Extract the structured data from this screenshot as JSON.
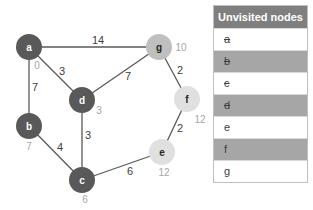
{
  "graph": {
    "nodes": [
      {
        "id": "a",
        "label": "a",
        "x": 29,
        "y": 47,
        "fill": "#595959",
        "text": "#ffffff",
        "dist": "0",
        "dx": 8,
        "dy": 18
      },
      {
        "id": "g",
        "label": "g",
        "x": 159,
        "y": 47,
        "fill": "#bfbfbf",
        "text": "#262626",
        "dist": "10",
        "dx": 22,
        "dy": 0
      },
      {
        "id": "d",
        "label": "d",
        "x": 82,
        "y": 100,
        "fill": "#595959",
        "text": "#ffffff",
        "dist": "3",
        "dx": 17,
        "dy": 10
      },
      {
        "id": "f",
        "label": "f",
        "x": 187,
        "y": 99,
        "fill": "#e0e0e0",
        "text": "#262626",
        "dist": "12",
        "dx": 13,
        "dy": 20
      },
      {
        "id": "b",
        "label": "b",
        "x": 29,
        "y": 126,
        "fill": "#595959",
        "text": "#ffffff",
        "dist": "7",
        "dx": 0,
        "dy": 20
      },
      {
        "id": "e",
        "label": "e",
        "x": 162,
        "y": 152,
        "fill": "#e0e0e0",
        "text": "#262626",
        "dist": "12",
        "dx": 2,
        "dy": 20
      },
      {
        "id": "c",
        "label": "c",
        "x": 82,
        "y": 180,
        "fill": "#595959",
        "text": "#ffffff",
        "dist": "6",
        "dx": 3,
        "dy": 19
      }
    ],
    "edges": [
      {
        "from": "a",
        "to": "g",
        "weight": "14",
        "lx": 98,
        "ly": 40
      },
      {
        "from": "a",
        "to": "d",
        "weight": "3",
        "lx": 62,
        "ly": 71
      },
      {
        "from": "a",
        "to": "b",
        "weight": "7",
        "lx": 35,
        "ly": 87
      },
      {
        "from": "g",
        "to": "d",
        "weight": "7",
        "lx": 128,
        "ly": 76
      },
      {
        "from": "g",
        "to": "f",
        "weight": "2",
        "lx": 180,
        "ly": 70
      },
      {
        "from": "d",
        "to": "c",
        "weight": "3",
        "lx": 88,
        "ly": 135
      },
      {
        "from": "b",
        "to": "c",
        "weight": "4",
        "lx": 60,
        "ly": 147
      },
      {
        "from": "f",
        "to": "e",
        "weight": "2",
        "lx": 180,
        "ly": 128
      },
      {
        "from": "c",
        "to": "e",
        "weight": "6",
        "lx": 130,
        "ly": 171
      }
    ],
    "edge_color": "#595959"
  },
  "table": {
    "header": "Unvisited nodes",
    "rows": [
      {
        "label": "a",
        "struck": true,
        "shade": false
      },
      {
        "label": "b",
        "struck": true,
        "shade": true
      },
      {
        "label": "c",
        "struck": true,
        "shade": false
      },
      {
        "label": "d",
        "struck": true,
        "shade": true
      },
      {
        "label": "e",
        "struck": false,
        "shade": false
      },
      {
        "label": "f",
        "struck": false,
        "shade": true
      },
      {
        "label": "g",
        "struck": false,
        "shade": false
      }
    ]
  }
}
